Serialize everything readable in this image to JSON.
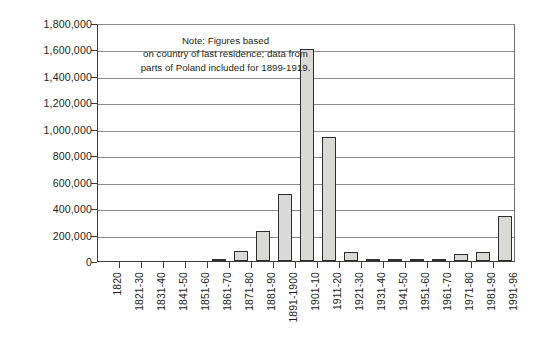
{
  "chart_data": {
    "type": "bar",
    "title": "",
    "subtitle": "",
    "xlabel": "",
    "ylabel": "",
    "ylim": [
      0,
      1800000
    ],
    "ytick_step": 200000,
    "grid": true,
    "legend": false,
    "legend_position": "none",
    "bar_fill_color": "#d9d9d6",
    "bar_border_color": "#2e2e2e",
    "grid_color": "#8c8c8c",
    "axis_color": "#3b3b3b",
    "text_color": "#231f20",
    "annotations": [
      {
        "name": "figures-note",
        "lines": [
          "Note: Figures based",
          "on country of last residence; data from",
          "parts of Poland included for 1899-1919."
        ]
      }
    ],
    "ytick_labels": [
      "1,800,000",
      "1,600,000",
      "1,400,000",
      "1,200,000",
      "1,000,000",
      "800,000",
      "600,000",
      "400,000",
      "200,000",
      "0"
    ],
    "ytick_values": [
      1800000,
      1600000,
      1400000,
      1200000,
      1000000,
      800000,
      600000,
      400000,
      200000,
      0
    ],
    "categories": [
      "1820",
      "1821-30",
      "1831-40",
      "1841-50",
      "1851-60",
      "1861-70",
      "1871-80",
      "1881-90",
      "1891-1900",
      "1901-10",
      "1911-20",
      "1921-30",
      "1931-40",
      "1941-50",
      "1951-60",
      "1961-70",
      "1971-80",
      "1981-90",
      "1991-96"
    ],
    "values": [
      0,
      0,
      0,
      0,
      0,
      8000,
      73000,
      226000,
      510000,
      1600000,
      940000,
      70000,
      7000,
      2000,
      8000,
      16000,
      55000,
      68000,
      340000
    ]
  }
}
